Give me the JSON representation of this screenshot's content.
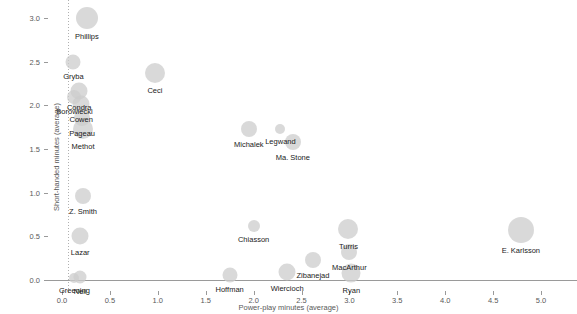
{
  "chart_data": {
    "type": "scatter",
    "title": "",
    "xlabel": "Power-play minutes (average)",
    "ylabel": "Short-handed minutes (average)",
    "xlim": [
      -0.15,
      5.2
    ],
    "ylim": [
      -0.2,
      3.15
    ],
    "xticks": [
      0.0,
      0.5,
      1.0,
      1.5,
      2.0,
      2.5,
      3.0,
      3.5,
      4.0,
      4.5,
      5.0
    ],
    "xticklabels": [
      "0.0",
      "0.5",
      "1.0",
      "1.5",
      "2.0",
      "2.5",
      "3.0",
      "3.5",
      "4.0",
      "4.5",
      "5.0"
    ],
    "yticks": [
      0.0,
      0.5,
      1.0,
      1.5,
      2.0,
      2.5,
      3.0
    ],
    "yticklabels": [
      "0.0",
      "0.5",
      "1.0",
      "1.5",
      "2.0",
      "2.5",
      "3.0"
    ],
    "grid": false,
    "reference_lines": [
      {
        "axis": "x",
        "value": 0.06,
        "style": "dotted"
      },
      {
        "axis": "y",
        "value": 0.0,
        "style": "solid"
      }
    ],
    "legend": null,
    "marker_color": "#cccccc",
    "label_color": "#1a1a1a",
    "size_encodes": "total ice time (bubble radius)",
    "points": [
      {
        "label": "Phillips",
        "x": 0.26,
        "y": 3.0,
        "r": 11.0
      },
      {
        "label": "Gryba",
        "x": 0.12,
        "y": 2.5,
        "r": 7.5
      },
      {
        "label": "Ceci",
        "x": 0.97,
        "y": 2.37,
        "r": 10.0
      },
      {
        "label": "Condra",
        "x": 0.18,
        "y": 2.16,
        "r": 8.5
      },
      {
        "label": "Borowiecki",
        "x": 0.13,
        "y": 2.1,
        "r": 7.0
      },
      {
        "label": "Cowen",
        "x": 0.2,
        "y": 2.02,
        "r": 8.5
      },
      {
        "label": "Pageau",
        "x": 0.21,
        "y": 1.86,
        "r": 8.0
      },
      {
        "label": "Methot",
        "x": 0.22,
        "y": 1.73,
        "r": 10.0
      },
      {
        "label": "Michalek",
        "x": 1.95,
        "y": 1.73,
        "r": 8.0
      },
      {
        "label": "Legwand",
        "x": 2.28,
        "y": 1.73,
        "r": 5.0
      },
      {
        "label": "Ma. Stone",
        "x": 2.41,
        "y": 1.58,
        "r": 8.0
      },
      {
        "label": "Z. Smith",
        "x": 0.22,
        "y": 0.96,
        "r": 8.0
      },
      {
        "label": "Chiasson",
        "x": 2.0,
        "y": 0.62,
        "r": 6.0
      },
      {
        "label": "Turris",
        "x": 2.99,
        "y": 0.58,
        "r": 10.0
      },
      {
        "label": "E. Karlsson",
        "x": 4.79,
        "y": 0.57,
        "r": 13.0
      },
      {
        "label": "Lazar",
        "x": 0.19,
        "y": 0.5,
        "r": 8.5
      },
      {
        "label": "MacArthur",
        "x": 3.0,
        "y": 0.32,
        "r": 8.0
      },
      {
        "label": "Zibanejad",
        "x": 2.62,
        "y": 0.23,
        "r": 8.0
      },
      {
        "label": "Wiercioch",
        "x": 2.35,
        "y": 0.09,
        "r": 8.5
      },
      {
        "label": "Ryan",
        "x": 3.02,
        "y": 0.08,
        "r": 9.5
      },
      {
        "label": "Hoffman",
        "x": 1.75,
        "y": 0.06,
        "r": 7.5
      },
      {
        "label": "Greening",
        "x": 0.13,
        "y": 0.02,
        "r": 5.0
      },
      {
        "label": "Neil",
        "x": 0.19,
        "y": 0.03,
        "r": 6.5
      }
    ]
  }
}
